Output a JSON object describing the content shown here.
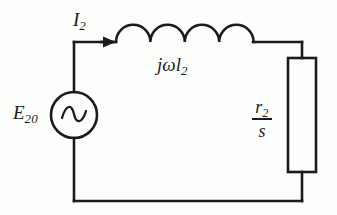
{
  "figure": {
    "background_color": "#fcfefc",
    "line_color": "#1a1a22"
  },
  "labels": {
    "source": {
      "base": "E",
      "sub": "20",
      "full": "E20"
    },
    "inductor": {
      "base": "jωl",
      "sub": "2",
      "full": "jωl2"
    },
    "current": {
      "base": "I",
      "sub": "2",
      "full": "I2"
    },
    "resistor": {
      "numerator_base": "r",
      "numerator_sub": "2",
      "denominator": "s",
      "full": "r2/s"
    }
  },
  "components": {
    "voltage_source": {
      "type": "ac-source",
      "symbol": "sine-wave",
      "cx": 74,
      "cy": 115,
      "r": 23
    },
    "inductor": {
      "type": "inductor",
      "coils": 4,
      "x_start": 116,
      "x_end": 253,
      "y": 42
    },
    "resistor": {
      "type": "resistor-box",
      "x": 288,
      "y": 58,
      "width": 28,
      "height": 114
    },
    "current_arrow": {
      "type": "arrow",
      "direction": "right",
      "x": 113,
      "y": 42
    }
  },
  "wires": {
    "top_left": {
      "x": 74,
      "y1": 42,
      "y2": 92
    },
    "top_rail": {
      "x1": 74,
      "x2": 116,
      "y": 42
    },
    "top_right_rail": {
      "x1": 253,
      "x2": 302,
      "y": 42
    },
    "right_upper": {
      "x": 302,
      "y1": 42,
      "y2": 58
    },
    "right_lower": {
      "x": 302,
      "y1": 172,
      "y2": 201
    },
    "bottom_rail": {
      "x1": 74,
      "x2": 302,
      "y": 201
    },
    "bottom_left": {
      "x": 74,
      "y1": 138,
      "y2": 201
    }
  }
}
